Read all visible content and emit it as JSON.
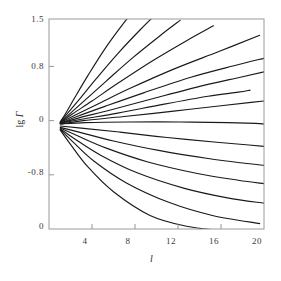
{
  "chart_data": {
    "type": "line",
    "title": "",
    "xlabel": "l",
    "ylabel": "lg Γ",
    "xlim": [
      0,
      20
    ],
    "ylim": [
      -1.6,
      1.5
    ],
    "grid": false,
    "legend": null,
    "xticks": [
      4,
      8,
      12,
      16,
      20
    ],
    "xticklabels": [
      "4",
      "8",
      "12",
      "16",
      "20"
    ],
    "yticks": [
      1.5,
      0.8,
      0,
      -0.8,
      -1.6
    ],
    "yticklabels": [
      "1.5",
      "0.8",
      "0",
      "-0.8",
      "0"
    ],
    "origin": {
      "x": 1.05,
      "y": -0.02
    },
    "series": [
      {
        "name": "curve-01",
        "x": [
          1.05,
          1.6,
          2.4,
          3.6,
          5.2,
          7.0,
          8.6
        ],
        "y": [
          -0.02,
          0.12,
          0.34,
          0.66,
          1.06,
          1.45,
          1.76
        ]
      },
      {
        "name": "curve-02",
        "x": [
          1.05,
          1.8,
          2.9,
          4.4,
          6.4,
          8.6,
          10.4
        ],
        "y": [
          -0.02,
          0.12,
          0.33,
          0.62,
          0.99,
          1.36,
          1.64
        ]
      },
      {
        "name": "curve-03",
        "x": [
          1.05,
          2.0,
          3.4,
          5.3,
          7.8,
          10.3,
          12.2
        ],
        "y": [
          -0.03,
          0.11,
          0.31,
          0.58,
          0.93,
          1.25,
          1.48
        ]
      },
      {
        "name": "curve-04",
        "x": [
          1.05,
          2.2,
          4.0,
          6.4,
          9.6,
          12.8,
          15.3
        ],
        "y": [
          -0.03,
          0.1,
          0.29,
          0.55,
          0.88,
          1.18,
          1.4
        ]
      },
      {
        "name": "curve-05",
        "x": [
          1.05,
          2.4,
          4.6,
          7.6,
          11.6,
          15.8,
          19.6
        ],
        "y": [
          -0.03,
          0.08,
          0.25,
          0.48,
          0.76,
          1.02,
          1.26
        ]
      },
      {
        "name": "curve-06",
        "x": [
          1.05,
          2.6,
          5.2,
          8.8,
          13.2,
          17.2,
          20.0
        ],
        "y": [
          -0.04,
          0.06,
          0.21,
          0.41,
          0.64,
          0.81,
          0.92
        ]
      },
      {
        "name": "curve-07",
        "x": [
          1.05,
          2.8,
          5.8,
          9.8,
          14.4,
          17.8,
          20.0
        ],
        "y": [
          -0.04,
          0.04,
          0.16,
          0.33,
          0.52,
          0.64,
          0.72
        ]
      },
      {
        "name": "curve-08",
        "x": [
          1.05,
          3.0,
          6.4,
          10.6,
          14.8,
          17.6,
          18.7
        ],
        "y": [
          -0.04,
          0.02,
          0.11,
          0.24,
          0.36,
          0.42,
          0.45
        ]
      },
      {
        "name": "curve-09",
        "x": [
          1.05,
          3.2,
          7.0,
          11.6,
          16.0,
          18.8,
          20.0
        ],
        "y": [
          -0.05,
          0.0,
          0.06,
          0.14,
          0.22,
          0.27,
          0.29
        ]
      },
      {
        "name": "curve-10",
        "x": [
          1.05,
          3.4,
          7.4,
          12.2,
          16.6,
          19.2,
          20.0
        ],
        "y": [
          -0.05,
          -0.03,
          -0.02,
          -0.02,
          -0.03,
          -0.04,
          -0.05
        ]
      },
      {
        "name": "curve-11",
        "x": [
          1.05,
          3.0,
          6.6,
          11.0,
          15.6,
          18.6,
          20.0
        ],
        "y": [
          -0.08,
          -0.11,
          -0.17,
          -0.25,
          -0.32,
          -0.36,
          -0.38
        ]
      },
      {
        "name": "curve-12",
        "x": [
          1.05,
          2.8,
          6.0,
          10.2,
          14.8,
          18.2,
          20.0
        ],
        "y": [
          -0.1,
          -0.17,
          -0.3,
          -0.44,
          -0.56,
          -0.63,
          -0.66
        ]
      },
      {
        "name": "curve-13",
        "x": [
          1.05,
          2.6,
          5.4,
          9.2,
          13.8,
          17.6,
          20.0
        ],
        "y": [
          -0.11,
          -0.22,
          -0.41,
          -0.61,
          -0.78,
          -0.88,
          -0.93
        ]
      },
      {
        "name": "curve-14",
        "x": [
          1.05,
          2.4,
          4.8,
          8.2,
          12.6,
          16.6,
          20.0
        ],
        "y": [
          -0.12,
          -0.27,
          -0.51,
          -0.77,
          -1.0,
          -1.14,
          -1.22
        ]
      },
      {
        "name": "curve-15",
        "x": [
          1.05,
          2.2,
          4.2,
          7.2,
          11.2,
          15.2,
          19.6
        ],
        "y": [
          -0.13,
          -0.31,
          -0.6,
          -0.92,
          -1.21,
          -1.4,
          -1.52
        ]
      },
      {
        "name": "curve-16",
        "x": [
          1.05,
          2.0,
          3.6,
          6.0,
          9.4,
          12.8,
          15.9
        ],
        "y": [
          -0.14,
          -0.35,
          -0.68,
          -1.05,
          -1.4,
          -1.56,
          -1.62
        ]
      }
    ]
  },
  "axes": {
    "y_title_prefix": "lg ",
    "y_title_symbol": "Γ",
    "x_title": "l",
    "y_tick_1": "1.5",
    "y_tick_2": "0.8",
    "y_tick_3": "0",
    "y_tick_4": "-0.8",
    "y_tick_5": "0",
    "x_tick_1": "4",
    "x_tick_2": "8",
    "x_tick_3": "12",
    "x_tick_4": "16",
    "x_tick_5": "20"
  },
  "style": {
    "curve_color": "#1a1a1a",
    "frame_color": "#9a9a9a",
    "tick_color": "#8a8a8a",
    "text_color": "#3a3a3a",
    "background": "#ffffff"
  }
}
